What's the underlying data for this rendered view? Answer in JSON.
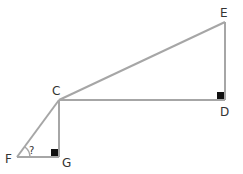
{
  "diagram": {
    "type": "geometry",
    "line_color": "#a6a6a6",
    "marker_color": "#111111",
    "points": {
      "E": {
        "label": "E",
        "x": 225,
        "y": 22
      },
      "D": {
        "label": "D",
        "x": 225,
        "y": 100
      },
      "C": {
        "label": "C",
        "x": 59,
        "y": 100
      },
      "G": {
        "label": "G",
        "x": 59,
        "y": 157
      },
      "F": {
        "label": "F",
        "x": 17,
        "y": 157
      }
    },
    "segments": [
      "CE",
      "ED",
      "CD",
      "CG",
      "FG",
      "FC"
    ],
    "right_angles": [
      "D",
      "G"
    ],
    "unknown_angle": {
      "vertex": "F",
      "label": "?"
    }
  }
}
